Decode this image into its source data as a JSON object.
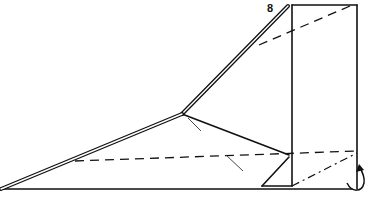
{
  "diagram": {
    "type": "origami-fold-diagram",
    "step_number": "8",
    "step_label_pos": {
      "x": 267,
      "y": 2
    },
    "ink_color": "#111111",
    "lines": {
      "solid": [
        {
          "x1": 292,
          "y1": 5,
          "x2": 357,
          "y2": 5
        },
        {
          "x1": 357,
          "y1": 5,
          "x2": 357,
          "y2": 189
        },
        {
          "x1": 292,
          "y1": 5,
          "x2": 292,
          "y2": 186
        },
        {
          "x1": 0,
          "y1": 189,
          "x2": 352,
          "y2": 189
        },
        {
          "x1": 182,
          "y1": 114,
          "x2": 289,
          "y2": 155
        },
        {
          "x1": 262,
          "y1": 186,
          "x2": 289,
          "y2": 157
        },
        {
          "x1": 262,
          "y1": 186,
          "x2": 292,
          "y2": 186
        }
      ],
      "double": [
        {
          "x1": 288,
          "y1": 6,
          "x2": 182,
          "y2": 114
        },
        {
          "x1": 182,
          "y1": 114,
          "x2": 1,
          "y2": 189
        }
      ],
      "valley_fold_dashed": [
        {
          "x1": 259,
          "y1": 45,
          "x2": 350,
          "y2": 6
        },
        {
          "x1": 75,
          "y1": 161,
          "x2": 357,
          "y2": 151
        }
      ],
      "mountain_fold_dashdot": [
        {
          "x1": 292,
          "y1": 186,
          "x2": 357,
          "y2": 153
        }
      ],
      "hint_strokes": [
        {
          "x1": 188,
          "y1": 118,
          "x2": 201,
          "y2": 131
        },
        {
          "x1": 226,
          "y1": 155,
          "x2": 243,
          "y2": 171
        }
      ]
    },
    "arrow": {
      "kind": "fold-behind",
      "path": "M347,183 C352,193 362,192 364,183 C365,177 362,171 359,166",
      "head": "359,164 356,172 364,170"
    }
  }
}
